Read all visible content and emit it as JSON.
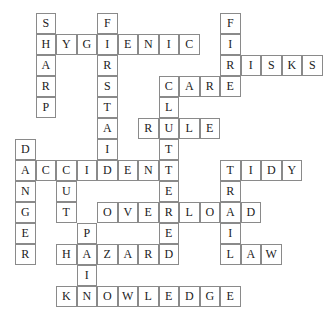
{
  "puzzle": {
    "type": "crossword",
    "solution_grid_rows": [
      ".S..F.....F....",
      ".HYGIENIC.I....",
      ".A..R.....RISKS",
      ".R..S..CARE....",
      ".P..T..L.......",
      "....A.RULE.....",
      "D...I..T.......",
      "ACCIDENT..TIDY.",
      "N.U....E..R....",
      "G.T.OVERLOAD...",
      "E..P...E..I....",
      "R.HAZARD..LAW..",
      "...I...........",
      "..KNOWLEDGE...."
    ],
    "words": [
      {
        "word": "SHARP",
        "direction": "down",
        "row": 0,
        "col": 1
      },
      {
        "word": "FIRSTAID",
        "direction": "down",
        "row": 0,
        "col": 4
      },
      {
        "word": "FIRE",
        "direction": "down",
        "row": 0,
        "col": 10
      },
      {
        "word": "HYGIENIC",
        "direction": "across",
        "row": 1,
        "col": 1
      },
      {
        "word": "RISKS",
        "direction": "across",
        "row": 2,
        "col": 10
      },
      {
        "word": "CARE",
        "direction": "across",
        "row": 3,
        "col": 7
      },
      {
        "word": "CLUTTERED",
        "direction": "down",
        "row": 3,
        "col": 7
      },
      {
        "word": "RULE",
        "direction": "across",
        "row": 5,
        "col": 6
      },
      {
        "word": "DANGER",
        "direction": "down",
        "row": 6,
        "col": 0
      },
      {
        "word": "ACCIDENT",
        "direction": "across",
        "row": 7,
        "col": 0
      },
      {
        "word": "CUT",
        "direction": "down",
        "row": 7,
        "col": 2
      },
      {
        "word": "TIDY",
        "direction": "across",
        "row": 7,
        "col": 10
      },
      {
        "word": "TRAIL",
        "direction": "down",
        "row": 7,
        "col": 10
      },
      {
        "word": "OVERLOAD",
        "direction": "across",
        "row": 9,
        "col": 4
      },
      {
        "word": "PAIN",
        "direction": "down",
        "row": 10,
        "col": 3
      },
      {
        "word": "HAZARD",
        "direction": "across",
        "row": 11,
        "col": 2
      },
      {
        "word": "LAW",
        "direction": "across",
        "row": 11,
        "col": 10
      },
      {
        "word": "KNOWLEDGE",
        "direction": "across",
        "row": 13,
        "col": 2
      }
    ]
  }
}
